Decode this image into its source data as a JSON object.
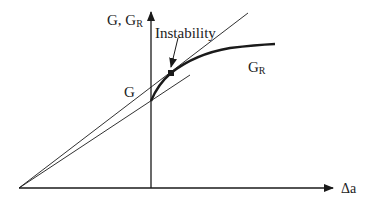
{
  "diagram": {
    "y_axis_label": "G, G",
    "y_axis_label_sub": "R",
    "x_axis_label": "Δa",
    "annotation": "Instability",
    "curve_G_label": "G",
    "curve_GR_label": "G",
    "curve_GR_label_sub": "R"
  },
  "colors": {
    "line": "#1a1a1a",
    "background": "#ffffff"
  }
}
